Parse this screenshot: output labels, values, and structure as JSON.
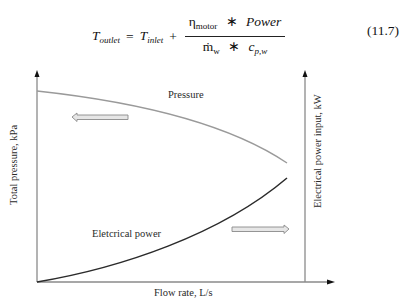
{
  "equation": {
    "lhs_symbol": "T",
    "lhs_sub": "outlet",
    "equals": "=",
    "rhs_symbol": "T",
    "rhs_sub": "inlet",
    "plus": "+",
    "numerator_eta": "η",
    "numerator_eta_sub": "motor",
    "numerator_times": "∗",
    "numerator_power": "Power",
    "denominator_mdot": "ṁ",
    "denominator_mdot_sub": "w",
    "denominator_times": "∗",
    "denominator_c": "c",
    "denominator_c_sub": "p,w",
    "number": "(11.7)"
  },
  "diagram": {
    "x_axis_label": "Flow rate, L/s",
    "y_axis_left_label": "Total pressure, kPa",
    "y_axis_right_label": "Electrical power input, kW",
    "curves": [
      {
        "name": "Pressure",
        "label": "Pressure",
        "color": "#9a9a9a",
        "trend": "decreasing",
        "arrow_direction": "left",
        "axis": "left"
      },
      {
        "name": "Electrical power",
        "label": "Eletcrical power",
        "color": "#2b2b2b",
        "trend": "increasing",
        "arrow_direction": "right",
        "axis": "right"
      }
    ],
    "colors": {
      "axis": "#8a8a8a",
      "pressure_curve": "#9a9a9a",
      "power_curve": "#2b2b2b",
      "arrow_fill": "#e6e6e6",
      "arrow_stroke": "#8a8a8a"
    }
  }
}
